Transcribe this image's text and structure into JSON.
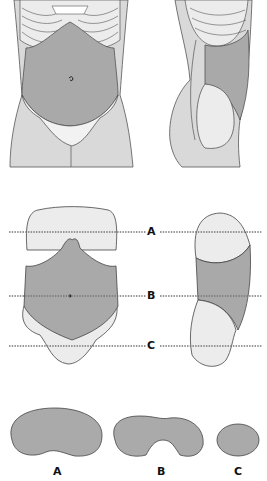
{
  "colors": {
    "abdomen": "#a9a9a9",
    "skin": "#d9d9d9",
    "light": "#ececec",
    "outline": "#333333",
    "dotted_line": "#777777"
  },
  "levels": {
    "A": "A",
    "B": "B",
    "C": "C"
  },
  "cross_sections": [
    {
      "label": "A"
    },
    {
      "label": "B"
    },
    {
      "label": "C"
    }
  ]
}
